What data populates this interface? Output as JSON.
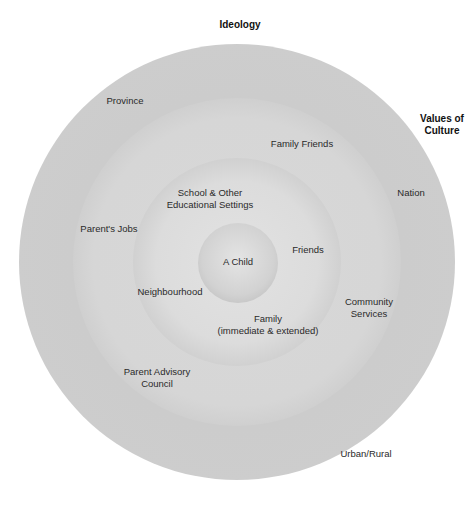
{
  "diagram": {
    "type": "concentric-circles",
    "center_label": "A Child",
    "outside_labels": {
      "top": "Ideology",
      "right": "Values of\nCulture"
    },
    "rings": [
      {
        "level": 1,
        "name": "innermost",
        "labels": [
          "A Child"
        ]
      },
      {
        "level": 2,
        "name": "microsystem",
        "labels": [
          "School & Other\nEducational Settings",
          "Friends",
          "Neighbourhood",
          "Family\n(immediate & extended)"
        ]
      },
      {
        "level": 3,
        "name": "exosystem",
        "labels": [
          "Family Friends",
          "Parent's Jobs",
          "Community\nServices",
          "Parent Advisory\nCouncil"
        ]
      },
      {
        "level": 4,
        "name": "macrosystem",
        "labels": [
          "Province",
          "Nation",
          "Urban/Rural"
        ]
      }
    ]
  },
  "labels": {
    "ideology": "Ideology",
    "values_of_culture": "Values of\nCulture",
    "province": "Province",
    "nation": "Nation",
    "urban_rural": "Urban/Rural",
    "family_friends": "Family Friends",
    "parents_jobs": "Parent's Jobs",
    "community_services": "Community\nServices",
    "parent_advisory_council": "Parent Advisory\nCouncil",
    "school": "School & Other\nEducational Settings",
    "friends": "Friends",
    "neighbourhood": "Neighbourhood",
    "family": "Family\n(immediate & extended)",
    "child": "A Child"
  },
  "colors": {
    "background": "#ffffff",
    "ring_outer": "#c4c4c4",
    "ring_second": "#d2d2d2",
    "ring_third": "#dadada",
    "ring_center": "#d0d0d0",
    "text": "#2a2a2a"
  }
}
